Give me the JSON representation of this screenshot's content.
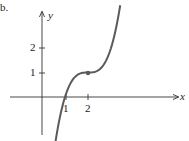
{
  "figure_label": "b.",
  "chart_data": {
    "type": "line",
    "title": "",
    "xlabel": "x",
    "ylabel": "y",
    "x_ticks": [
      "1",
      "2"
    ],
    "y_ticks": [
      "1",
      "2"
    ],
    "function": "y = (x - 2)^3 + 1",
    "x": [
      0.35,
      0.75,
      1.0,
      1.5,
      2.0,
      2.5,
      3.0,
      3.4
    ],
    "y": [
      -3.49,
      -0.95,
      0.0,
      0.875,
      1.0,
      1.125,
      2.0,
      3.74
    ],
    "marked_points": [
      {
        "x": 2,
        "y": 1
      }
    ],
    "xlim": [
      -1.6,
      4.6
    ],
    "ylim": [
      -1.6,
      3.9
    ],
    "grid": false,
    "color": "#5a5a5a"
  }
}
